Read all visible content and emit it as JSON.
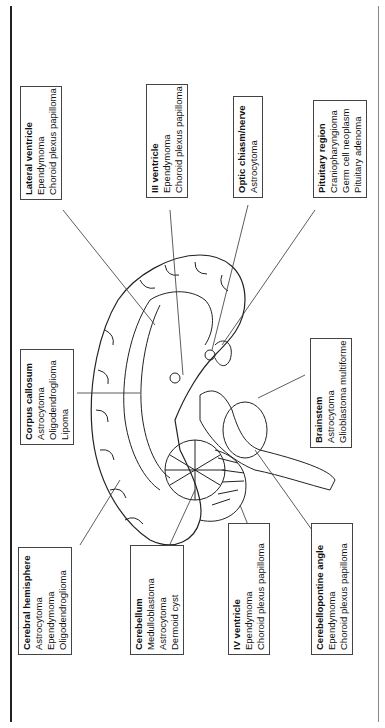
{
  "labels": {
    "lateral_ventricle": {
      "title": "Lateral ventricle",
      "items": [
        "Ependymoma",
        "Choroid plexus papilloma"
      ]
    },
    "iii_ventricle": {
      "title": "III ventricle",
      "items": [
        "Ependymoma",
        "Choroid plexus papilloma"
      ]
    },
    "optic_chiasm": {
      "title": "Optic chiasm/nerve",
      "items": [
        "Astrocytoma"
      ]
    },
    "pituitary": {
      "title": "Pituitary region",
      "items": [
        "Craniopharyngioma",
        "Germ cell neoplasm",
        "Pituitary adenoma"
      ]
    },
    "corpus_callosum": {
      "title": "Corpus callosum",
      "items": [
        "Astrocytoma",
        "Oligodendroglioma",
        "Lipoma"
      ]
    },
    "brainstem": {
      "title": "Brainstem",
      "items": [
        "Astrocytoma",
        "Glioblastoma multiforme"
      ]
    },
    "cerebral_hemisphere": {
      "title": "Cerebral hemisphere",
      "items": [
        "Astrocytoma",
        "Ependymoma",
        "Oligodendroglioma"
      ]
    },
    "cerebellum": {
      "title": "Cerebellum",
      "items": [
        "Medulloblastoma",
        "Astrocytoma",
        "Dermoid cyst"
      ]
    },
    "iv_ventricle": {
      "title": "IV ventricle",
      "items": [
        "Ependymoma",
        "Choroid plexus papilloma"
      ]
    },
    "cerebellopontine": {
      "title": "Cerebellopontine angle",
      "items": [
        "Ependymoma",
        "Choroid plexus papilloma"
      ]
    }
  }
}
